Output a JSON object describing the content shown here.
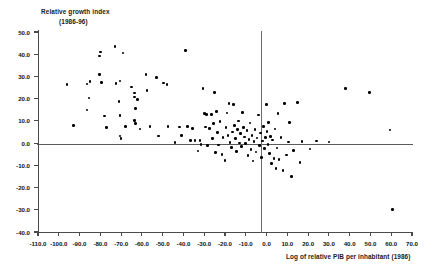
{
  "chart_data": {
    "type": "scatter",
    "title": "Relative growth index",
    "subtitle": "(1986-96)",
    "ylabel": "Relative growth index",
    "xlabel": "Log of relative PIB per inhabitant (1986)",
    "xlim": [
      -110.0,
      70.0
    ],
    "ylim": [
      -40.0,
      50.0
    ],
    "xticks": [
      "-110.0",
      "-100.0",
      "-90.0",
      "-80.0",
      "-70.0",
      "-60.0",
      "-50.0",
      "-40.0",
      "-30.0",
      "-20.0",
      "-10.0",
      "0.0",
      "10.0",
      "20.0",
      "30.0",
      "40.0",
      "50.0",
      "60.0",
      "70.0"
    ],
    "xtick_values": [
      -110,
      -100,
      -90,
      -80,
      -70,
      -60,
      -50,
      -40,
      -30,
      -20,
      -10,
      0,
      10,
      20,
      30,
      40,
      50,
      60,
      70
    ],
    "yticks": [
      "50.0",
      "40.0",
      "30.0",
      "20.0",
      "10.0",
      "0.0",
      "-10.0",
      "-20.0",
      "-30.0",
      "-40.0"
    ],
    "ytick_values": [
      50,
      40,
      30,
      20,
      10,
      0,
      -10,
      -20,
      -30,
      -40
    ],
    "grid": false,
    "legend": null,
    "zero_lines": {
      "horizontal": 0.0,
      "vertical": 0.0
    },
    "marker": {
      "shape": "circle",
      "color": "#000000",
      "size": 2.6
    },
    "n_points": 132,
    "points": [
      [
        -96.0,
        26.5
      ],
      [
        -93.0,
        7.8
      ],
      [
        -86.5,
        26.6
      ],
      [
        -85.0,
        27.8
      ],
      [
        -85.5,
        20.3
      ],
      [
        -86.5,
        14.9
      ],
      [
        -80.0,
        41.0
      ],
      [
        -80.5,
        31.0
      ],
      [
        -80.5,
        39.2
      ],
      [
        -79.5,
        27.2
      ],
      [
        -78.0,
        12.2
      ],
      [
        -77.0,
        7.0
      ],
      [
        -73.0,
        43.6
      ],
      [
        -72.5,
        26.8
      ],
      [
        -70.5,
        27.9
      ],
      [
        -71.0,
        18.6
      ],
      [
        -70.5,
        12.5
      ],
      [
        -70.5,
        3.2
      ],
      [
        -70.0,
        2.2
      ],
      [
        -69.0,
        40.5
      ],
      [
        -68.0,
        7.5
      ],
      [
        -65.0,
        25.2
      ],
      [
        -63.5,
        20.8
      ],
      [
        -63.5,
        22.6
      ],
      [
        -63.0,
        15.6
      ],
      [
        -63.5,
        10.1
      ],
      [
        -63.0,
        8.7
      ],
      [
        -62.0,
        19.7
      ],
      [
        -61.0,
        6.4
      ],
      [
        -58.0,
        31.0
      ],
      [
        -57.5,
        23.8
      ],
      [
        -56.0,
        7.6
      ],
      [
        -53.0,
        29.5
      ],
      [
        -52.0,
        3.2
      ],
      [
        -49.5,
        27.0
      ],
      [
        -48.0,
        26.5
      ],
      [
        -47.5,
        7.5
      ],
      [
        -44.0,
        0.2
      ],
      [
        -42.0,
        7.3
      ],
      [
        -41.0,
        3.3
      ],
      [
        -39.0,
        41.8
      ],
      [
        -38.0,
        7.6
      ],
      [
        -36.5,
        1.2
      ],
      [
        -35.5,
        6.6
      ],
      [
        -34.5,
        1.3
      ],
      [
        -33.0,
        -3.5
      ],
      [
        -32.0,
        1.1
      ],
      [
        -31.5,
        -0.5
      ],
      [
        -30.5,
        24.7
      ],
      [
        -30.0,
        13.2
      ],
      [
        -29.5,
        7.2
      ],
      [
        -29.0,
        12.9
      ],
      [
        -28.5,
        -1.2
      ],
      [
        -27.5,
        6.6
      ],
      [
        -26.5,
        13.0
      ],
      [
        -26.0,
        2.0
      ],
      [
        -25.5,
        8.8
      ],
      [
        -25.0,
        22.9
      ],
      [
        -24.5,
        -4.2
      ],
      [
        -24.0,
        14.2
      ],
      [
        -23.5,
        4.9
      ],
      [
        -23.0,
        -0.8
      ],
      [
        -22.5,
        9.7
      ],
      [
        -21.5,
        -5.0
      ],
      [
        -21.0,
        2.6
      ],
      [
        -20.0,
        -7.8
      ],
      [
        -19.5,
        6.9
      ],
      [
        -19.0,
        13.6
      ],
      [
        -18.5,
        3.4
      ],
      [
        -18.0,
        17.8
      ],
      [
        -17.5,
        0.4
      ],
      [
        -17.0,
        -2.0
      ],
      [
        -16.5,
        5.0
      ],
      [
        -16.0,
        17.5
      ],
      [
        -15.5,
        8.0
      ],
      [
        -15.0,
        2.1
      ],
      [
        -14.5,
        -3.9
      ],
      [
        -14.0,
        6.2
      ],
      [
        -13.5,
        9.9
      ],
      [
        -13.0,
        0.1
      ],
      [
        -12.5,
        4.3
      ],
      [
        -12.0,
        -1.6
      ],
      [
        -11.5,
        13.7
      ],
      [
        -11.0,
        6.9
      ],
      [
        -10.5,
        2.8
      ],
      [
        -10.0,
        -0.2
      ],
      [
        -9.5,
        5.6
      ],
      [
        -9.0,
        -5.6
      ],
      [
        -8.5,
        1.6
      ],
      [
        -8.0,
        9.0
      ],
      [
        -7.5,
        -2.8
      ],
      [
        -7.0,
        3.3
      ],
      [
        -6.5,
        -8.0
      ],
      [
        -6.0,
        0.6
      ],
      [
        -5.5,
        6.0
      ],
      [
        -5.0,
        -4.0
      ],
      [
        -4.5,
        2.3
      ],
      [
        -4.0,
        12.7
      ],
      [
        -3.5,
        -1.0
      ],
      [
        -3.0,
        4.5
      ],
      [
        -2.5,
        -6.4
      ],
      [
        -2.0,
        0.9
      ],
      [
        -1.5,
        7.4
      ],
      [
        -1.0,
        -2.5
      ],
      [
        -0.5,
        2.6
      ],
      [
        0.0,
        17.3
      ],
      [
        0.3,
        5.1
      ],
      [
        0.6,
        -0.6
      ],
      [
        1.0,
        9.4
      ],
      [
        1.5,
        -4.6
      ],
      [
        2.0,
        3.0
      ],
      [
        2.5,
        -9.3
      ],
      [
        3.0,
        1.4
      ],
      [
        3.5,
        -6.8
      ],
      [
        4.0,
        6.3
      ],
      [
        4.5,
        -11.5
      ],
      [
        5.0,
        -2.2
      ],
      [
        5.5,
        13.3
      ],
      [
        6.0,
        -7.3
      ],
      [
        7.0,
        2.4
      ],
      [
        8.0,
        -12.3
      ],
      [
        8.5,
        17.9
      ],
      [
        9.5,
        -5.3
      ],
      [
        10.5,
        0.5
      ],
      [
        11.0,
        9.2
      ],
      [
        12.0,
        -15.0
      ],
      [
        13.0,
        -3.2
      ],
      [
        15.0,
        18.3
      ],
      [
        16.0,
        -8.6
      ],
      [
        17.0,
        0.8
      ],
      [
        21.0,
        -2.6
      ],
      [
        24.0,
        1.0
      ],
      [
        30.0,
        0.5
      ],
      [
        38.0,
        24.7
      ],
      [
        49.5,
        22.8
      ],
      [
        59.5,
        5.9
      ],
      [
        60.5,
        -30.0
      ]
    ]
  }
}
